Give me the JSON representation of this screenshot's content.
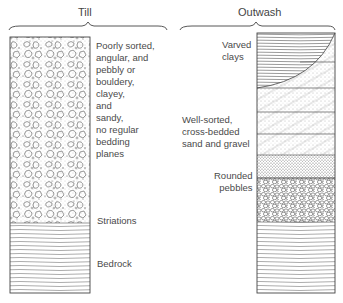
{
  "columns": {
    "till": {
      "title": "Till",
      "description": "Poorly sorted,\nangular, and\npebbly or\nbouldery,\nclayey,\nand\nsandy,\nno regular\nbedding\nplanes",
      "striations": "Striations",
      "bedrock": "Bedrock"
    },
    "outwash": {
      "title": "Outwash",
      "varved": "Varved\nclays",
      "sand": "Well-sorted,\ncross-bedded\nsand and gravel",
      "pebbles": "Rounded\npebbles"
    }
  },
  "colors": {
    "ink": "#3a3a3a",
    "background": "#ffffff"
  }
}
